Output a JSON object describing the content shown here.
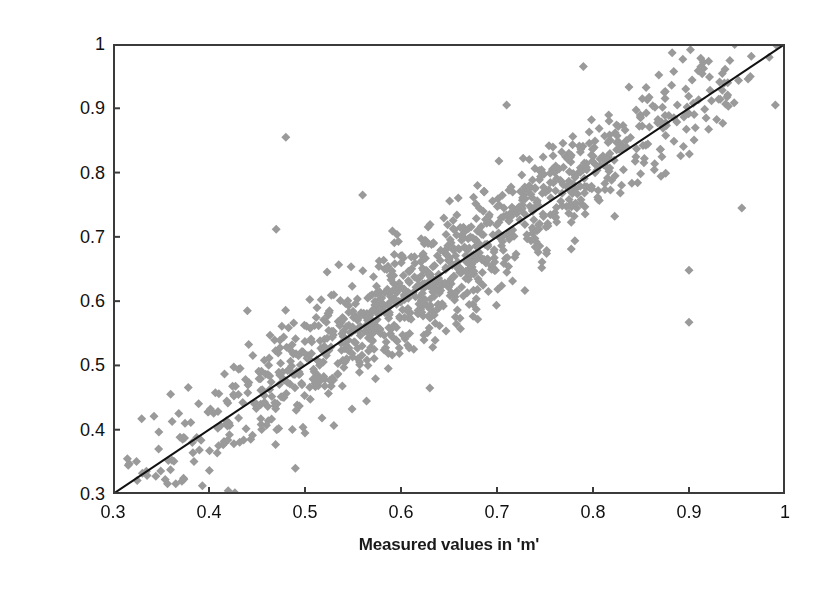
{
  "chart_data": {
    "type": "scatter",
    "title": "",
    "subtitle": "",
    "xlabel": "Measured values in 'm'",
    "ylabel": "Predicted values in 'm'",
    "xlim": [
      0.3,
      1.0
    ],
    "ylim": [
      0.3,
      1.0
    ],
    "xticks": [
      "0.3",
      "0.4",
      "0.5",
      "0.6",
      "0.7",
      "0.8",
      "0.9",
      "1"
    ],
    "yticks": [
      "0.3",
      "0.4",
      "0.5",
      "0.6",
      "0.7",
      "0.8",
      "0.9",
      "1"
    ],
    "xtick_values": [
      0.3,
      0.4,
      0.5,
      0.6,
      0.7,
      0.8,
      0.9,
      1.0
    ],
    "ytick_values": [
      0.3,
      0.4,
      0.5,
      0.6,
      0.7,
      0.8,
      0.9,
      1.0
    ],
    "grid": false,
    "legend": "none",
    "marker": {
      "shape": "diamond",
      "size_px": 9,
      "color": "#9a9a9a",
      "edge_color": "#8f8f8f"
    },
    "reference_line": {
      "name": "1:1 line",
      "from": [
        0.3,
        0.3
      ],
      "to": [
        1.0,
        1.0
      ],
      "color": "#111111",
      "width_px": 2
    },
    "series": [
      {
        "name": "Measured vs Predicted",
        "n_points": 1100,
        "color": "#9a9a9a",
        "description": "Dense elongated cloud hugging the 1:1 line from (0.30,0.30) to (1.00,1.00); spread widens slightly toward mid-range, a few low and high outliers.",
        "cloud": {
          "x_min": 0.3,
          "x_max": 1.0,
          "residual_sd": 0.035,
          "residual_sd_mid": 0.045
        },
        "outliers": [
          [
            0.48,
            0.855
          ],
          [
            0.47,
            0.712
          ],
          [
            0.44,
            0.585
          ],
          [
            0.36,
            0.455
          ],
          [
            0.315,
            0.355
          ],
          [
            0.42,
            0.305
          ],
          [
            0.49,
            0.34
          ],
          [
            0.5,
            0.395
          ],
          [
            0.56,
            0.765
          ],
          [
            0.63,
            0.465
          ],
          [
            0.71,
            0.905
          ],
          [
            0.79,
            0.965
          ],
          [
            0.9,
            0.567
          ],
          [
            0.9,
            0.648
          ],
          [
            0.955,
            0.745
          ],
          [
            0.99,
            0.905
          ]
        ]
      }
    ]
  }
}
